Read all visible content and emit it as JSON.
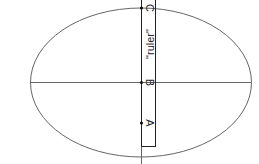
{
  "diagram": {
    "ruler_label": "\"ruler\"",
    "points": [
      {
        "id": "C",
        "label": "C"
      },
      {
        "id": "B",
        "label": "B"
      },
      {
        "id": "A",
        "label": "A"
      }
    ],
    "colors": {
      "stroke": "#555555",
      "ruler": "#222222",
      "background": "#ffffff"
    }
  }
}
